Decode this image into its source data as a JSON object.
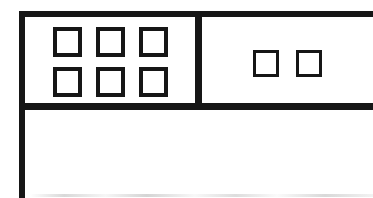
{
  "figure": {
    "type": "wireframe-line-drawing",
    "colors": {
      "ink": "#161616",
      "paper": "#ffffff"
    },
    "window": {
      "visible_edges": [
        "left",
        "top"
      ],
      "cut_off_edges": [
        "right",
        "bottom"
      ]
    },
    "toolbar": {
      "left_group": {
        "rows": 2,
        "columns": 3,
        "buttons": [
          {
            "label": ""
          },
          {
            "label": ""
          },
          {
            "label": ""
          },
          {
            "label": ""
          },
          {
            "label": ""
          },
          {
            "label": ""
          }
        ]
      },
      "right_group": {
        "rows": 1,
        "columns": 2,
        "buttons": [
          {
            "label": ""
          },
          {
            "label": ""
          }
        ]
      }
    }
  }
}
